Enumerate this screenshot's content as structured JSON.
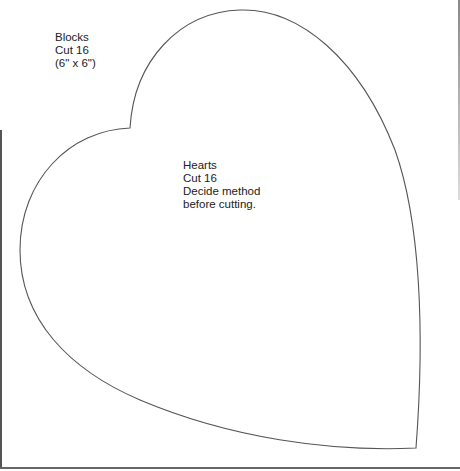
{
  "pattern": {
    "blocks_note": {
      "lines": [
        "Blocks",
        "Cut 16",
        "(6\" x 6\")"
      ]
    },
    "hearts_note": {
      "lines": [
        "Hearts",
        "Cut 16",
        "Decide method",
        "before cutting."
      ]
    },
    "shape": "heart-template",
    "stroke_color": "#555555",
    "background_color": "#ffffff"
  }
}
